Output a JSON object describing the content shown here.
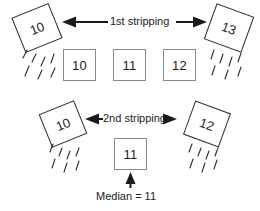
{
  "diagram": {
    "background": "#ffffff",
    "stroke_dark": "#2b2b2b",
    "stroke_gray": "#8a8a8a",
    "text_color": "#1b1b1b"
  },
  "rows": [
    {
      "id": "first-stripping",
      "arrow_label": "1st stripping",
      "stripped_left": {
        "value": "10",
        "rotation_deg": -22
      },
      "stripped_right": {
        "value": "13",
        "rotation_deg": 20
      },
      "remaining": [
        {
          "value": "10"
        },
        {
          "value": "11"
        },
        {
          "value": "12"
        }
      ]
    },
    {
      "id": "second-stripping",
      "arrow_label": "2nd stripping",
      "stripped_left": {
        "value": "10",
        "rotation_deg": -22
      },
      "stripped_right": {
        "value": "12",
        "rotation_deg": 20
      },
      "remaining": [
        {
          "value": "11"
        }
      ]
    }
  ],
  "result": {
    "caption": "Median = 11",
    "value": "11"
  }
}
